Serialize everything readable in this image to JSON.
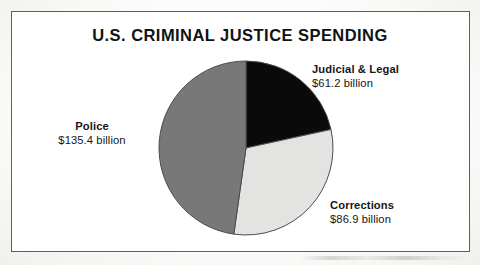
{
  "figure": {
    "background_color": "#fdfdfb",
    "frame_color": "#5e5e5e"
  },
  "chart_data": {
    "type": "pie",
    "title": "U.S. CRIMINAL JUSTICE SPENDING",
    "subtitle": "",
    "xlabel": "",
    "ylabel": "",
    "unit": "billion USD",
    "value_prefix": "$",
    "value_suffix": " billion",
    "total": 283.5,
    "start_angle_deg": 0,
    "direction": "clockwise",
    "legend_position": "outside-labels",
    "grid": false,
    "categories": [
      "Judicial & Legal",
      "Corrections",
      "Police"
    ],
    "values": [
      61.2,
      86.9,
      135.4
    ],
    "percentages": [
      21.6,
      30.7,
      47.8
    ],
    "colors": [
      "#0a0a0a",
      "#e3e3e1",
      "#787878"
    ],
    "slices": [
      {
        "label": "Judicial & Legal",
        "value": 61.2,
        "value_text": "$61.2 billion",
        "percent": 21.6,
        "angle_deg": 77.7,
        "color": "#0a0a0a",
        "label_position": "right-top"
      },
      {
        "label": "Corrections",
        "value": 86.9,
        "value_text": "$86.9 billion",
        "percent": 30.7,
        "angle_deg": 110.4,
        "color": "#e3e3e1",
        "label_position": "right-bottom"
      },
      {
        "label": "Police",
        "value": 135.4,
        "value_text": "$135.4 billion",
        "percent": 47.8,
        "angle_deg": 171.9,
        "color": "#787878",
        "label_position": "left-middle"
      }
    ],
    "geometry": {
      "center_x": 246,
      "center_y": 148,
      "radius": 87,
      "outline_color": "#4c4c4c"
    }
  }
}
